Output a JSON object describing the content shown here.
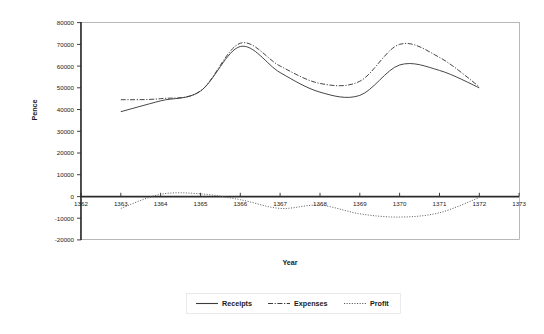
{
  "chart_data": {
    "type": "line",
    "title": "",
    "xlabel": "Year",
    "ylabel": "Pence",
    "xlim": [
      1362,
      1373
    ],
    "ylim": [
      -20000,
      80000
    ],
    "grid": false,
    "legend_position": "bottom",
    "xticks": [
      1362,
      1363,
      1364,
      1365,
      1366,
      1367,
      1368,
      1369,
      1370,
      1371,
      1372,
      1373
    ],
    "yticks": [
      -20000,
      -10000,
      0,
      10000,
      20000,
      30000,
      40000,
      50000,
      60000,
      70000,
      80000
    ],
    "x": [
      1363,
      1364,
      1365,
      1366,
      1367,
      1368,
      1369,
      1370,
      1371,
      1372
    ],
    "series": [
      {
        "name": "Receipts",
        "style": "solid",
        "values": [
          39000,
          44000,
          48500,
          69000,
          57000,
          48000,
          46500,
          60500,
          58000,
          50000
        ]
      },
      {
        "name": "Expenses",
        "style": "dash-dot",
        "values": [
          44500,
          45000,
          48500,
          70500,
          60000,
          52000,
          53000,
          70000,
          64000,
          50500
        ]
      },
      {
        "name": "Profit",
        "style": "dotted",
        "values": [
          -5500,
          1000,
          1200,
          -1500,
          -5500,
          -4000,
          -8000,
          -9500,
          -7500,
          -500
        ]
      }
    ]
  },
  "legend": {
    "items": [
      {
        "label": "Receipts",
        "style": "solid"
      },
      {
        "label": "Expenses",
        "style": "dash-dot"
      },
      {
        "label": "Profit",
        "style": "dotted"
      }
    ]
  },
  "axes": {
    "y_title": "Pence",
    "x_title": "Year",
    "y_tick_labels": [
      "80000",
      "70000",
      "60000",
      "50000",
      "40000",
      "30000",
      "20000",
      "10000",
      "0",
      "-10000",
      "-20000"
    ],
    "x_tick_labels": [
      "1362",
      "1363",
      "1364",
      "1365",
      "1366",
      "1367",
      "1368",
      "1369",
      "1370",
      "1371",
      "1372",
      "1373"
    ]
  },
  "colors": {
    "receipts": "#3c3c3c",
    "expenses": "#3c3c3c",
    "profit": "#555555",
    "axis": "#2b2b2b",
    "frame": "#9a9a9a",
    "background": "#ffffff"
  }
}
